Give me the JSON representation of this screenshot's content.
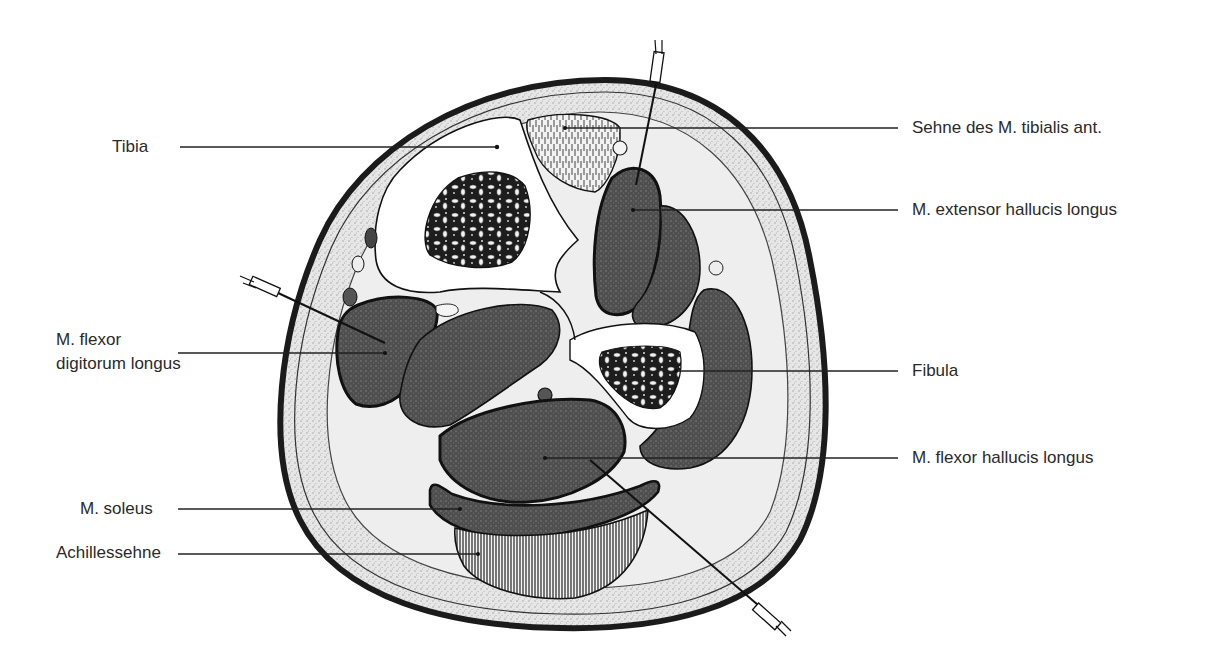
{
  "figure": {
    "colors": {
      "background": "#ffffff",
      "skin_edge": "#1e1e1e",
      "subcutaneous": "#e4e4e4",
      "muscle": "#555555",
      "bone_cortex": "#ffffff",
      "tendon_hatch": "#333333",
      "lines": "#222222"
    }
  },
  "labels": {
    "tibia": "Tibia",
    "flexor_digitorum_1": "M. flexor",
    "flexor_digitorum_2": "digitorum longus",
    "soleus": "M. soleus",
    "achillessehne": "Achillessehne",
    "tibialis_ant": "Sehne des M. tibialis ant.",
    "extensor_hallucis": "M. extensor hallucis longus",
    "fibula": "Fibula",
    "flexor_hallucis": "M. flexor hallucis longus"
  },
  "needles": [
    {
      "name": "needle-anterior",
      "entry": "top",
      "target": "M. extensor hallucis longus"
    },
    {
      "name": "needle-medial",
      "entry": "left",
      "target": "M. flexor digitorum longus"
    },
    {
      "name": "needle-posterior",
      "entry": "bottom-right",
      "target": "M. flexor hallucis longus"
    }
  ]
}
